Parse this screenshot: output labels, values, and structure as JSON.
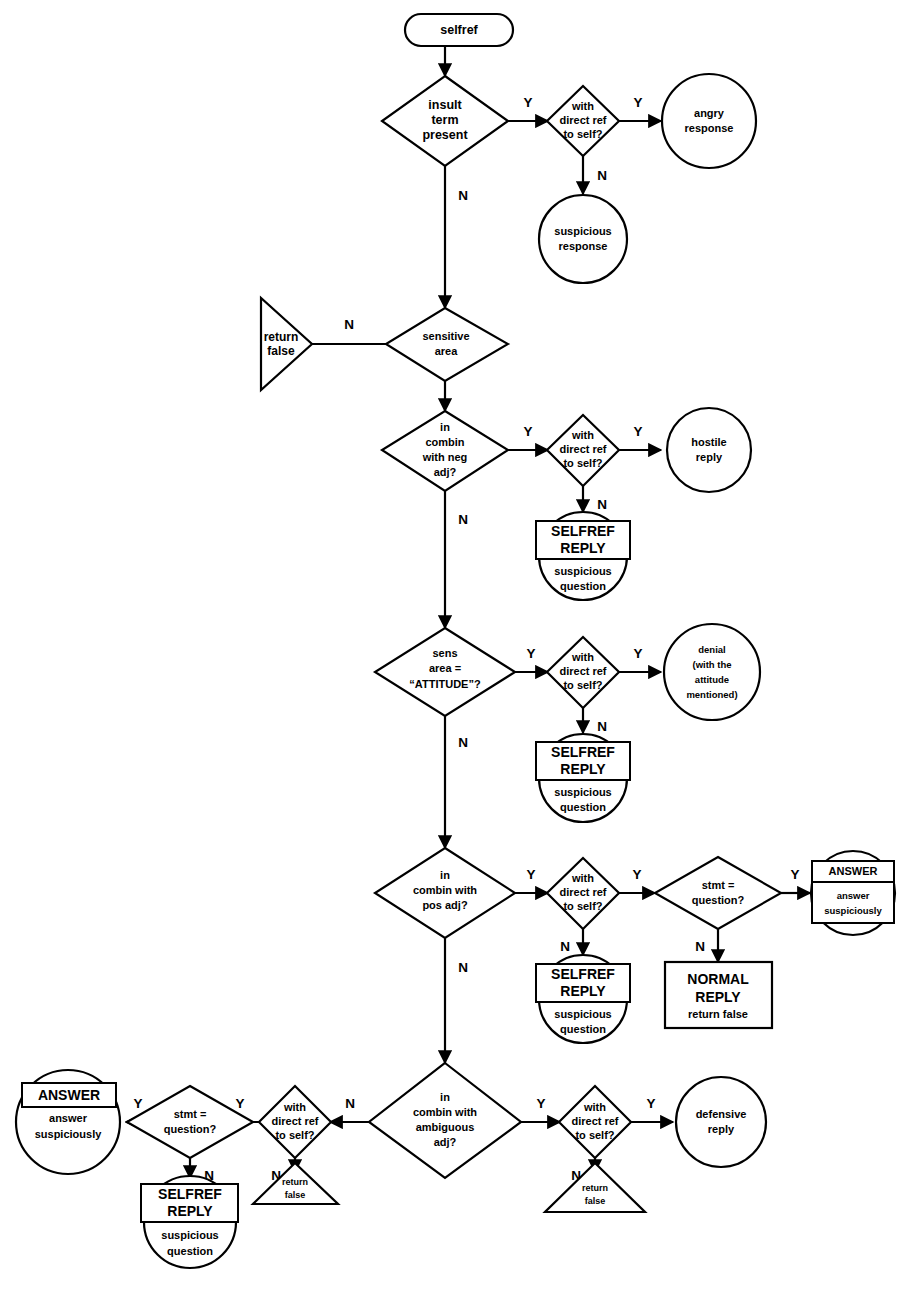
{
  "diagram": {
    "title": "selfref",
    "type": "flowchart",
    "start": {
      "label": "selfref",
      "shape": "rounded-rectangle"
    },
    "edge_labels": {
      "yes": "Y",
      "no": "N"
    },
    "colors": {
      "stroke": "#000000",
      "fill": "#ffffff",
      "background": "#ffffff"
    },
    "nodes": [
      {
        "id": "start",
        "shape": "terminator",
        "lines": [
          "selfref"
        ]
      },
      {
        "id": "d-insult",
        "shape": "diamond",
        "lines": [
          "insult",
          "term",
          "present"
        ]
      },
      {
        "id": "d-insult-ref",
        "shape": "diamond",
        "lines": [
          "with",
          "direct ref",
          "to self?"
        ]
      },
      {
        "id": "c-angry",
        "shape": "circle",
        "lines": [
          "angry",
          "response"
        ]
      },
      {
        "id": "c-suspicious",
        "shape": "circle",
        "lines": [
          "suspicious",
          "response"
        ]
      },
      {
        "id": "d-sensitive",
        "shape": "diamond",
        "lines": [
          "sensitive",
          "area"
        ]
      },
      {
        "id": "t-return-false-1",
        "shape": "triangle-right",
        "lines": [
          "return",
          "false"
        ]
      },
      {
        "id": "d-neg",
        "shape": "diamond",
        "lines": [
          "in",
          "combin",
          "with neg",
          "adj?"
        ]
      },
      {
        "id": "d-neg-ref",
        "shape": "diamond",
        "lines": [
          "with",
          "direct ref",
          "to self?"
        ]
      },
      {
        "id": "c-hostile",
        "shape": "circle",
        "lines": [
          "hostile",
          "reply"
        ]
      },
      {
        "id": "c-selfref-1",
        "shape": "circle-boxed",
        "box_lines": [
          "SELFREF",
          "REPLY"
        ],
        "lines": [
          "suspicious",
          "question"
        ]
      },
      {
        "id": "d-attitude",
        "shape": "diamond",
        "lines": [
          "sens",
          "area =",
          "“ATTITUDE”?"
        ]
      },
      {
        "id": "d-attitude-ref",
        "shape": "diamond",
        "lines": [
          "with",
          "direct ref",
          "to self?"
        ]
      },
      {
        "id": "c-denial",
        "shape": "circle",
        "lines": [
          "denial",
          "(with the",
          "attitude",
          "mentioned)"
        ]
      },
      {
        "id": "c-selfref-2",
        "shape": "circle-boxed",
        "box_lines": [
          "SELFREF",
          "REPLY"
        ],
        "lines": [
          "suspicious",
          "question"
        ]
      },
      {
        "id": "d-pos",
        "shape": "diamond",
        "lines": [
          "in",
          "combin with",
          "pos adj?"
        ]
      },
      {
        "id": "d-pos-ref",
        "shape": "diamond",
        "lines": [
          "with",
          "direct ref",
          "to self?"
        ]
      },
      {
        "id": "d-pos-stmt",
        "shape": "diamond",
        "lines": [
          "stmt =",
          "question?"
        ]
      },
      {
        "id": "c-answer-1",
        "shape": "circle-boxed-2",
        "box_header": "ANSWER",
        "box_lines": [
          "answer",
          "suspiciously"
        ]
      },
      {
        "id": "c-selfref-3",
        "shape": "circle-boxed",
        "box_lines": [
          "SELFREF",
          "REPLY"
        ],
        "lines": [
          "suspicious",
          "question"
        ]
      },
      {
        "id": "r-normal",
        "shape": "rectangle",
        "lines": [
          "NORMAL",
          "REPLY",
          "return false"
        ]
      },
      {
        "id": "d-amb",
        "shape": "diamond",
        "lines": [
          "in",
          "combin with",
          "ambiguous",
          "adj?"
        ]
      },
      {
        "id": "d-amb-ref-right",
        "shape": "diamond",
        "lines": [
          "with",
          "direct ref",
          "to self?"
        ]
      },
      {
        "id": "c-defensive",
        "shape": "circle",
        "lines": [
          "defensive",
          "reply"
        ]
      },
      {
        "id": "t-return-false-right",
        "shape": "triangle-down",
        "lines": [
          "return",
          "false"
        ]
      },
      {
        "id": "d-amb-ref-left",
        "shape": "diamond",
        "lines": [
          "with",
          "direct ref",
          "to self?"
        ]
      },
      {
        "id": "t-return-false-left",
        "shape": "triangle-down",
        "lines": [
          "return",
          "false"
        ]
      },
      {
        "id": "d-amb-stmt",
        "shape": "diamond",
        "lines": [
          "stmt =",
          "question?"
        ]
      },
      {
        "id": "c-answer-2",
        "shape": "circle-boxed-header",
        "box_header": "ANSWER",
        "lines": [
          "answer",
          "suspiciously"
        ]
      },
      {
        "id": "c-selfref-4",
        "shape": "circle-boxed",
        "box_lines": [
          "SELFREF",
          "REPLY"
        ],
        "lines": [
          "suspicious",
          "question"
        ]
      }
    ],
    "edges": [
      {
        "from": "start",
        "to": "d-insult",
        "label": ""
      },
      {
        "from": "d-insult",
        "to": "d-insult-ref",
        "label": "Y"
      },
      {
        "from": "d-insult-ref",
        "to": "c-angry",
        "label": "Y"
      },
      {
        "from": "d-insult-ref",
        "to": "c-suspicious",
        "label": "N"
      },
      {
        "from": "d-insult",
        "to": "d-sensitive",
        "label": "N"
      },
      {
        "from": "d-sensitive",
        "to": "t-return-false-1",
        "label": "N"
      },
      {
        "from": "d-sensitive",
        "to": "d-neg",
        "label": ""
      },
      {
        "from": "d-neg",
        "to": "d-neg-ref",
        "label": "Y"
      },
      {
        "from": "d-neg-ref",
        "to": "c-hostile",
        "label": "Y"
      },
      {
        "from": "d-neg-ref",
        "to": "c-selfref-1",
        "label": "N"
      },
      {
        "from": "d-neg",
        "to": "d-attitude",
        "label": "N"
      },
      {
        "from": "d-attitude",
        "to": "d-attitude-ref",
        "label": "Y"
      },
      {
        "from": "d-attitude-ref",
        "to": "c-denial",
        "label": "Y"
      },
      {
        "from": "d-attitude-ref",
        "to": "c-selfref-2",
        "label": "N"
      },
      {
        "from": "d-attitude",
        "to": "d-pos",
        "label": "N"
      },
      {
        "from": "d-pos",
        "to": "d-pos-ref",
        "label": "Y"
      },
      {
        "from": "d-pos-ref",
        "to": "d-pos-stmt",
        "label": "Y"
      },
      {
        "from": "d-pos-stmt",
        "to": "c-answer-1",
        "label": "Y"
      },
      {
        "from": "d-pos-ref",
        "to": "c-selfref-3",
        "label": "N"
      },
      {
        "from": "d-pos-stmt",
        "to": "r-normal",
        "label": "N"
      },
      {
        "from": "d-pos",
        "to": "d-amb",
        "label": "N"
      },
      {
        "from": "d-amb",
        "to": "d-amb-ref-right",
        "label": "Y"
      },
      {
        "from": "d-amb-ref-right",
        "to": "c-defensive",
        "label": "Y"
      },
      {
        "from": "d-amb-ref-right",
        "to": "t-return-false-right",
        "label": "N"
      },
      {
        "from": "d-amb",
        "to": "d-amb-ref-left",
        "label": "N"
      },
      {
        "from": "d-amb-ref-left",
        "to": "d-amb-stmt",
        "label": "Y"
      },
      {
        "from": "d-amb-ref-left",
        "to": "t-return-false-left",
        "label": "N"
      },
      {
        "from": "d-amb-stmt",
        "to": "c-answer-2",
        "label": "Y"
      },
      {
        "from": "d-amb-stmt",
        "to": "c-selfref-4",
        "label": "N"
      }
    ]
  },
  "text": {
    "selfref": "selfref",
    "insult_1": "insult",
    "insult_2": "term",
    "insult_3": "present",
    "with": "with",
    "direct_ref": "direct ref",
    "to_self": "to self?",
    "angry_1": "angry",
    "angry_2": "response",
    "susp_1": "suspicious",
    "susp_2": "response",
    "sensitive_1": "sensitive",
    "sensitive_2": "area",
    "return": "return",
    "false": "false",
    "neg_1": "in",
    "neg_2": "combin",
    "neg_3": "with neg",
    "neg_4": "adj?",
    "hostile_1": "hostile",
    "hostile_2": "reply",
    "selfref_box_1": "SELFREF",
    "selfref_box_2": "REPLY",
    "suspicious": "suspicious",
    "question": "question",
    "att_1": "sens",
    "att_2": "area =",
    "att_3": "“ATTITUDE”?",
    "denial_1": "denial",
    "denial_2": "(with the",
    "denial_3": "attitude",
    "denial_4": "mentioned)",
    "pos_1": "in",
    "pos_2": "combin with",
    "pos_3": "pos adj?",
    "stmt_1": "stmt =",
    "stmt_2": "question?",
    "answer_hdr": "ANSWER",
    "answer_1": "answer",
    "answer_2": "suspiciously",
    "normal_1": "NORMAL",
    "normal_2": "REPLY",
    "normal_3": "return false",
    "amb_1": "in",
    "amb_2": "combin with",
    "amb_3": "ambiguous",
    "amb_4": "adj?",
    "defensive_1": "defensive",
    "defensive_2": "reply",
    "Y": "Y",
    "N": "N"
  }
}
